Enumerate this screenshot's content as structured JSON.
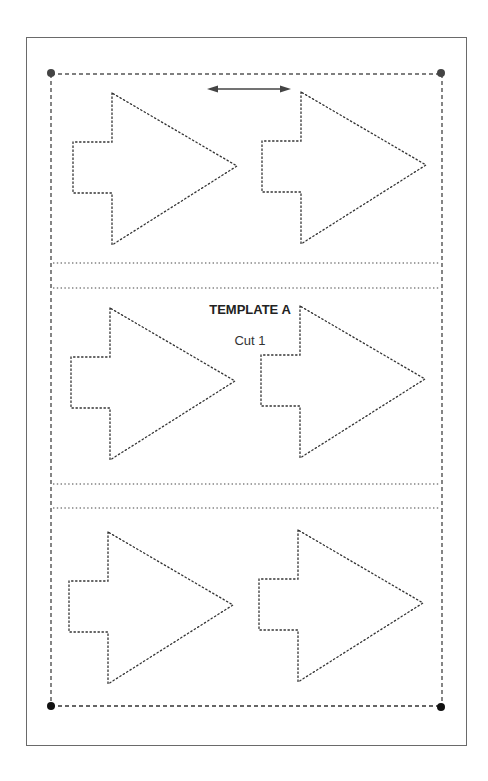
{
  "template": {
    "title": "TEMPLATE A",
    "instruction": "Cut 1"
  },
  "diagram": {
    "shape": "arrow",
    "rows": 3,
    "arrows_per_row": 2,
    "direction_indicator": "double-headed horizontal arrow",
    "colors": {
      "line": "#333333",
      "frame": "#6a6a6a",
      "background": "#ffffff"
    }
  }
}
